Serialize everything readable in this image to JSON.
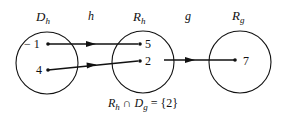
{
  "sets": {
    "domain_h": {
      "label": "D",
      "sub": "h"
    },
    "range_h": {
      "label": "R",
      "sub": "h"
    },
    "range_g": {
      "label": "R",
      "sub": "g"
    }
  },
  "functions": {
    "h": "h",
    "g": "g"
  },
  "elements": {
    "dh_1": "− 1",
    "dh_2": "4",
    "rh_1": "5",
    "rh_2": "2",
    "rg_1": "7"
  },
  "caption": {
    "r": "R",
    "r_sub": "h",
    "cap": " ∩ ",
    "d": "D",
    "d_sub": "g",
    "rest": " = {2}"
  }
}
